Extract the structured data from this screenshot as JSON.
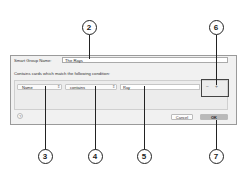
{
  "dialog": {
    "name_label": "Smart Group Name:",
    "name_value": "The Rays",
    "instructions": "Contains cards which match the following condition:",
    "criteria": {
      "field_popup": "Name",
      "operator_popup": "contains",
      "value": "Ray",
      "popup_arrows": "⇕",
      "remove_label": "−",
      "add_label": "+"
    },
    "help_label": "?",
    "cancel_label": "Cancel",
    "ok_label": "OK"
  },
  "callouts": [
    "2",
    "6",
    "3",
    "4",
    "5",
    "7"
  ]
}
